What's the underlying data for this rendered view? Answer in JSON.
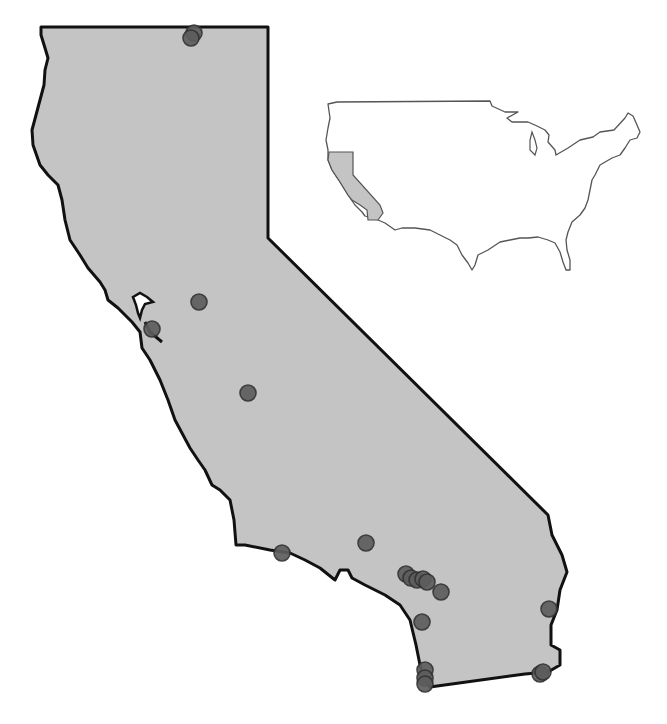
{
  "map": {
    "region": "California",
    "fill_color": "#c4c4c4",
    "border_color": "#111111",
    "point_color": "#5d5d5d",
    "background": "#ffffff"
  },
  "inset": {
    "region": "Contiguous United States",
    "highlighted_state": "California",
    "highlight_color": "#c4c4c4",
    "outline_color": "#555555"
  },
  "points": [
    {
      "id": "p1",
      "x": 194,
      "y": 33,
      "label": "Northern border site A"
    },
    {
      "id": "p2",
      "x": 191,
      "y": 38,
      "label": "Northern border site B"
    },
    {
      "id": "p3",
      "x": 199,
      "y": 302,
      "label": "Sacramento area site"
    },
    {
      "id": "p4",
      "x": 152,
      "y": 329,
      "label": "Bay Area site"
    },
    {
      "id": "p5",
      "x": 248,
      "y": 393,
      "label": "Central Valley site"
    },
    {
      "id": "p6",
      "x": 282,
      "y": 553,
      "label": "Central coast site"
    },
    {
      "id": "p7",
      "x": 366,
      "y": 543,
      "label": "Inland site"
    },
    {
      "id": "p8",
      "x": 406,
      "y": 574,
      "label": "LA cluster site 1"
    },
    {
      "id": "p9",
      "x": 411,
      "y": 578,
      "label": "LA cluster site 2"
    },
    {
      "id": "p10",
      "x": 417,
      "y": 580,
      "label": "LA cluster site 3"
    },
    {
      "id": "p11",
      "x": 423,
      "y": 579,
      "label": "LA cluster site 4"
    },
    {
      "id": "p12",
      "x": 427,
      "y": 582,
      "label": "LA cluster site 5"
    },
    {
      "id": "p13",
      "x": 441,
      "y": 592,
      "label": "LA cluster site 6"
    },
    {
      "id": "p14",
      "x": 422,
      "y": 622,
      "label": "Orange County site"
    },
    {
      "id": "p15",
      "x": 425,
      "y": 670,
      "label": "San Diego site A"
    },
    {
      "id": "p16",
      "x": 425,
      "y": 678,
      "label": "San Diego site B"
    },
    {
      "id": "p17",
      "x": 425,
      "y": 684,
      "label": "San Diego site C"
    },
    {
      "id": "p18",
      "x": 549,
      "y": 609,
      "label": "Colorado River site"
    },
    {
      "id": "p19",
      "x": 540,
      "y": 674,
      "label": "Southeast border site A"
    },
    {
      "id": "p20",
      "x": 543,
      "y": 672,
      "label": "Southeast border site B"
    }
  ]
}
